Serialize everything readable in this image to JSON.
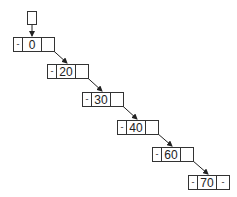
{
  "diagram": {
    "type": "doubly-linked-list",
    "head_pointer": {
      "label": ""
    },
    "null_marker": "-",
    "nodes": [
      {
        "value": "0",
        "prev": "-",
        "next": "•",
        "x": 13,
        "y": 37
      },
      {
        "value": "20",
        "prev": "-",
        "next": "•",
        "x": 47,
        "y": 64
      },
      {
        "value": "30",
        "prev": "-",
        "next": "•",
        "x": 82,
        "y": 92
      },
      {
        "value": "40",
        "prev": "-",
        "next": "•",
        "x": 117,
        "y": 120
      },
      {
        "value": "60",
        "prev": "-",
        "next": "•",
        "x": 152,
        "y": 147
      },
      {
        "value": "70",
        "prev": "-",
        "next": "-",
        "x": 188,
        "y": 175
      }
    ],
    "colors": {
      "stroke": "#333333",
      "background": "#ffffff",
      "text": "#222222"
    }
  }
}
